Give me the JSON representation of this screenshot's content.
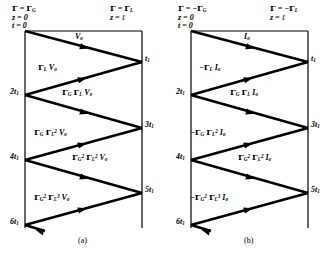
{
  "figure": {
    "caption_a": "(a)",
    "caption_b": "(b)",
    "type": "bounce-diagram",
    "width": 332,
    "height": 256,
    "line_color": "#000000",
    "background": "#ffffff"
  },
  "panel_a": {
    "header_left_line1": "Γ = ΓG",
    "header_left_line2": "z = 0",
    "header_left_line3": "t = 0",
    "header_right_line1": "Γ = ΓL",
    "header_right_line2": "z = ℓ",
    "time_ticks": [
      "t1",
      "2t1",
      "3t1",
      "4t1",
      "5t1",
      "6t1"
    ],
    "wave_labels": [
      "Vo",
      "ΓL Vo",
      "ΓG ΓL Vo",
      "ΓG ΓL² Vo",
      "ΓG² ΓL² Vo",
      "ΓG² ΓL³ Vo"
    ]
  },
  "panel_b": {
    "header_left_line1": "Γ = −ΓG",
    "header_left_line2": "z = 0",
    "header_left_line3": "t = 0",
    "header_right_line1": "Γ = −ΓL",
    "header_right_line2": "z = ℓ",
    "time_ticks": [
      "t1",
      "2t1",
      "3t1",
      "4t1",
      "5t1",
      "6t1"
    ],
    "wave_labels": [
      "Io",
      "−ΓL Io",
      "ΓG ΓL Io",
      "−ΓG ΓL² Io",
      "ΓG² ΓL² Io",
      "−ΓG² ΓL³ Io"
    ]
  },
  "chart_data": {
    "type": "line",
    "xlabel": "z",
    "ylabel": "t",
    "xlim": [
      0,
      1
    ],
    "ylim": [
      0,
      6
    ],
    "grid": false,
    "legend": "none",
    "series": [
      {
        "name": "panel-a-voltage-wave",
        "comment": "zig-zag reflections, z from 0 to l, t in units of t1",
        "x": [
          0,
          1,
          0,
          1,
          0,
          1,
          0
        ],
        "t": [
          0,
          1,
          2,
          3,
          4,
          5,
          6
        ],
        "segment_labels": [
          "Vo",
          "ΓL Vo",
          "ΓG ΓL Vo",
          "ΓG ΓL² Vo",
          "ΓG² ΓL² Vo",
          "ΓG² ΓL³ Vo"
        ]
      },
      {
        "name": "panel-b-current-wave",
        "comment": "zig-zag reflections, z from 0 to l, t in units of t1",
        "x": [
          0,
          1,
          0,
          1,
          0,
          1,
          0
        ],
        "t": [
          0,
          1,
          2,
          3,
          4,
          5,
          6
        ],
        "segment_labels": [
          "Io",
          "−ΓL Io",
          "ΓG ΓL Io",
          "−ΓG ΓL² Io",
          "ΓG² ΓL² Io",
          "−ΓG² ΓL³ Io"
        ]
      }
    ]
  }
}
